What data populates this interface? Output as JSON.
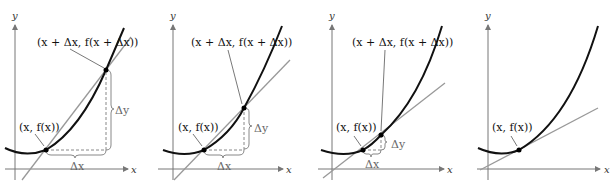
{
  "figure": {
    "colors": {
      "curve": "#111111",
      "secant": "#999999",
      "axis": "#777777",
      "dashed": "#888888",
      "point": "#000000"
    },
    "axis_labels": {
      "x": "x",
      "y": "y"
    },
    "panels": [
      {
        "point_label": "(x, f(x))",
        "point2_label": "(x + Δx, f(x + Δx))",
        "dx_label": "Δx",
        "dy_label": "Δy"
      },
      {
        "point_label": "(x, f(x))",
        "point2_label": "(x + Δx, f(x + Δx))",
        "dx_label": "Δx",
        "dy_label": "Δy"
      },
      {
        "point_label": "(x, f(x))",
        "point2_label": "(x + Δx, f(x + Δx))",
        "dx_label": "Δx",
        "dy_label": "Δy"
      },
      {
        "point_label": "(x, f(x))"
      }
    ]
  }
}
